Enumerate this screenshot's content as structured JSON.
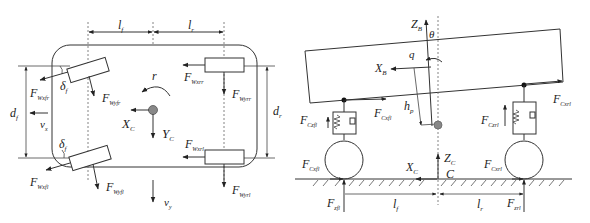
{
  "left_panel": {
    "title": "Top view (yaw plane)",
    "dimensions": {
      "front_length": {
        "main": "l",
        "sub": "f"
      },
      "rear_length": {
        "main": "l",
        "sub": "r"
      },
      "front_track": {
        "main": "d",
        "sub": "f"
      },
      "rear_track": {
        "main": "d",
        "sub": "r"
      }
    },
    "angles": {
      "steer_front_upper": {
        "main": "δ",
        "sub": "f"
      },
      "steer_front_lower": {
        "main": "δ",
        "sub": "f"
      }
    },
    "forces": {
      "wxfr": {
        "main": "F",
        "sub": "Wxfr"
      },
      "wyfr": {
        "main": "F",
        "sub": "Wyfr"
      },
      "wxrr": {
        "main": "F",
        "sub": "Wxrr"
      },
      "wyrr": {
        "main": "F",
        "sub": "Wyrr"
      },
      "wxfl": {
        "main": "F",
        "sub": "Wxfl"
      },
      "wyfl": {
        "main": "F",
        "sub": "Wyfl"
      },
      "wxrl": {
        "main": "F",
        "sub": "Wxrl"
      },
      "wyrl": {
        "main": "F",
        "sub": "Wyrl"
      }
    },
    "velocities": {
      "vx": {
        "main": "v",
        "sub": "x"
      },
      "vy": {
        "main": "v",
        "sub": "y"
      }
    },
    "yaw_rate": "r",
    "axes": {
      "xc": {
        "main": "X",
        "sub": "C"
      },
      "yc": {
        "main": "Y",
        "sub": "C"
      }
    }
  },
  "right_panel": {
    "title": "Side view (pitch plane)",
    "axes": {
      "zb": {
        "main": "Z",
        "sub": "B"
      },
      "xb": {
        "main": "X",
        "sub": "B"
      },
      "zc": {
        "main": "Z",
        "sub": "C"
      },
      "xc": {
        "main": "X",
        "sub": "C"
      }
    },
    "pitch_angle": "θ",
    "pitch_rate": "q",
    "cg_height": {
      "main": "h",
      "sub": "p"
    },
    "ground_point": "C",
    "forces": {
      "cxrl_body": {
        "main": "F",
        "sub": "Cxrl"
      },
      "cxfl_body": {
        "main": "F",
        "sub": "Cxfl"
      },
      "czfl": {
        "main": "F",
        "sub": "Czfl"
      },
      "czrl": {
        "main": "F",
        "sub": "Czrl"
      },
      "cxfl_tire": {
        "main": "F",
        "sub": "Cxfl"
      },
      "cxrl_tire": {
        "main": "F",
        "sub": "Cxrl"
      },
      "zfl": {
        "main": "F",
        "sub": "zfl"
      },
      "zrl": {
        "main": "F",
        "sub": "zrl"
      }
    },
    "dimensions": {
      "front_length": {
        "main": "l",
        "sub": "f"
      },
      "rear_length": {
        "main": "l",
        "sub": "r"
      }
    }
  }
}
